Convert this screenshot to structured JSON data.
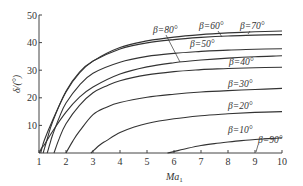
{
  "chart_data": {
    "type": "line",
    "title": "",
    "xlabel": "Ma",
    "xlabel_sub": "1",
    "ylabel": "δ/(°)",
    "xlim": [
      1,
      10
    ],
    "ylim": [
      0,
      50
    ],
    "xticks": [
      1,
      2,
      3,
      4,
      5,
      6,
      7,
      8,
      9,
      10
    ],
    "yticks": [
      10,
      20,
      30,
      40,
      50
    ],
    "grid": false,
    "legend": "inline labels",
    "series": [
      {
        "name": "β=80°",
        "label": "β=80°",
        "x": [
          1.015,
          1.1,
          1.2,
          1.5,
          2,
          2.5,
          3,
          4,
          5,
          6,
          7,
          8,
          9,
          10
        ],
        "y": [
          0,
          1.9,
          3.0,
          7.8,
          14.8,
          20.2,
          23.9,
          28.6,
          31.2,
          32.7,
          33.7,
          34.4,
          34.9,
          35.2
        ]
      },
      {
        "name": "β=70°",
        "label": "β=70°",
        "x": [
          1.064,
          1.1,
          1.2,
          1.5,
          2,
          2.5,
          3,
          4,
          5,
          6,
          7,
          8,
          9,
          10
        ],
        "y": [
          0,
          1.4,
          4.7,
          11.8,
          22.1,
          29.0,
          33.3,
          38.2,
          40.6,
          42.0,
          42.9,
          43.5,
          43.9,
          44.2
        ]
      },
      {
        "name": "β=60°",
        "label": "β=60°",
        "x": [
          1.155,
          1.2,
          1.3,
          1.5,
          2,
          2.5,
          3,
          4,
          5,
          6,
          7,
          8,
          9,
          10
        ],
        "y": [
          0,
          1.6,
          4.9,
          11.2,
          22.4,
          29.3,
          33.3,
          37.7,
          39.9,
          41.1,
          41.9,
          42.4,
          42.7,
          42.9
        ]
      },
      {
        "name": "β=50°",
        "label": "β=50°",
        "x": [
          1.305,
          1.4,
          1.5,
          1.75,
          2,
          2.5,
          3,
          4,
          5,
          6,
          7,
          8,
          9,
          10
        ],
        "y": [
          0,
          3.2,
          6.4,
          12.9,
          18.1,
          24.6,
          28.9,
          32.9,
          35.0,
          36.1,
          36.8,
          37.3,
          37.6,
          37.8
        ]
      },
      {
        "name": "β=40°",
        "label": "β=40°",
        "x": [
          1.556,
          1.75,
          2,
          2.5,
          3,
          3.5,
          4,
          5,
          6,
          7,
          8,
          9,
          10
        ],
        "y": [
          0,
          5.3,
          10.6,
          17.3,
          21.8,
          24.3,
          26.2,
          28.3,
          29.5,
          30.2,
          30.6,
          30.9,
          31.1
        ]
      },
      {
        "name": "β=30°",
        "label": "β=30°",
        "x": [
          2,
          2.25,
          2.5,
          3,
          3.5,
          4,
          5,
          6,
          7,
          8,
          9,
          10
        ],
        "y": [
          0,
          4.3,
          7.9,
          13.9,
          16.6,
          18.3,
          20.2,
          21.3,
          22.1,
          22.6,
          23.0,
          23.4
        ]
      },
      {
        "name": "β=20°",
        "label": "β=20°",
        "x": [
          2.924,
          3.25,
          3.5,
          4,
          4.5,
          5,
          6,
          7,
          8,
          9,
          10
        ],
        "y": [
          0,
          2.9,
          4.5,
          7.4,
          9.3,
          10.7,
          12.4,
          13.5,
          14.2,
          14.7,
          15.0
        ]
      },
      {
        "name": "β=10°",
        "label": "β=10°",
        "x": [
          5.76,
          6,
          6.5,
          7,
          7.5,
          8,
          8.5,
          9,
          9.5,
          10
        ],
        "y": [
          0,
          0.5,
          1.7,
          2.7,
          3.4,
          4.0,
          4.5,
          4.9,
          5.2,
          5.5
        ]
      },
      {
        "name": "β=90°",
        "label": "β=90°",
        "x": [
          1,
          10
        ],
        "y": [
          0,
          0
        ]
      }
    ]
  }
}
